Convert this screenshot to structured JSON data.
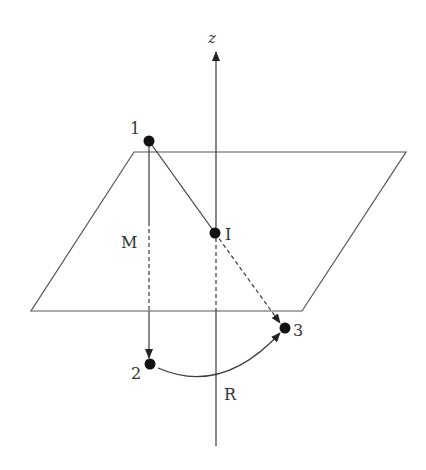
{
  "diagram": {
    "colors": {
      "line": "#3a3a3a",
      "plane": "#555555",
      "point": "#111111",
      "text": "#333333",
      "background": "#ffffff"
    },
    "axis": {
      "label": "z",
      "top": [
        216,
        50
      ],
      "bottom": [
        216,
        446
      ]
    },
    "plane": {
      "corners": [
        [
          134,
          152
        ],
        [
          406,
          152
        ],
        [
          302,
          311
        ],
        [
          31,
          311
        ]
      ]
    },
    "points": [
      {
        "id": "1",
        "label": "1",
        "x": 149,
        "y": 141,
        "label_x": 131,
        "label_y": 134
      },
      {
        "id": "I",
        "label": "I",
        "x": 215,
        "y": 233,
        "label_x": 225,
        "label_y": 239
      },
      {
        "id": "2",
        "label": "2",
        "x": 150,
        "y": 364,
        "label_x": 131,
        "label_y": 378
      },
      {
        "id": "3",
        "label": "3",
        "x": 284,
        "y": 328,
        "label_x": 293,
        "label_y": 336
      }
    ],
    "labels": {
      "M": "M",
      "R": "R",
      "z": "z"
    },
    "label_positions": {
      "M": [
        120,
        247
      ],
      "R": [
        225,
        400
      ],
      "z": [
        207,
        43
      ]
    },
    "edges": [
      {
        "from": "1",
        "to": "I",
        "style": "solid",
        "arrow": false
      },
      {
        "from": "I",
        "to": "3",
        "style": "dashed",
        "arrow": true
      },
      {
        "from": "1",
        "to": "2",
        "style": "mixed",
        "arrow": true,
        "note": "solid above plane, dashed across plane, solid below"
      },
      {
        "from": "2",
        "to": "3",
        "style": "arc",
        "arrow": true
      }
    ]
  }
}
